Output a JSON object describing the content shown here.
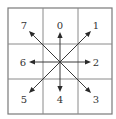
{
  "diagram": {
    "type": "freeman-chain-code-8-direction",
    "grid": {
      "rows": 3,
      "cols": 3,
      "x0": 8,
      "y0": 8,
      "x1": 112,
      "y1": 114,
      "v_lines": [
        43,
        78
      ],
      "h_lines": [
        44,
        79
      ],
      "line_color": "#8a8a8a"
    },
    "center": {
      "x": 60,
      "y": 62
    },
    "arrow_color": "#2a2a2a",
    "directions": [
      {
        "code": "0",
        "label": "0",
        "name": "up",
        "tip": {
          "x": 60,
          "y": 32
        },
        "label_pos": {
          "x": 60,
          "y": 25
        }
      },
      {
        "code": "1",
        "label": "1",
        "name": "up-right",
        "tip": {
          "x": 91,
          "y": 31
        },
        "label_pos": {
          "x": 96,
          "y": 25
        }
      },
      {
        "code": "2",
        "label": "2",
        "name": "right",
        "tip": {
          "x": 91,
          "y": 62
        },
        "label_pos": {
          "x": 96,
          "y": 62
        }
      },
      {
        "code": "3",
        "label": "3",
        "name": "down-right",
        "tip": {
          "x": 91,
          "y": 93
        },
        "label_pos": {
          "x": 96,
          "y": 99
        }
      },
      {
        "code": "4",
        "label": "4",
        "name": "down",
        "tip": {
          "x": 60,
          "y": 92
        },
        "label_pos": {
          "x": 60,
          "y": 99
        }
      },
      {
        "code": "5",
        "label": "5",
        "name": "down-left",
        "tip": {
          "x": 29,
          "y": 93
        },
        "label_pos": {
          "x": 24,
          "y": 99
        }
      },
      {
        "code": "6",
        "label": "6",
        "name": "left",
        "tip": {
          "x": 29,
          "y": 62
        },
        "label_pos": {
          "x": 23,
          "y": 62
        }
      },
      {
        "code": "7",
        "label": "7",
        "name": "up-left",
        "tip": {
          "x": 29,
          "y": 31
        },
        "label_pos": {
          "x": 24,
          "y": 25
        }
      }
    ]
  }
}
